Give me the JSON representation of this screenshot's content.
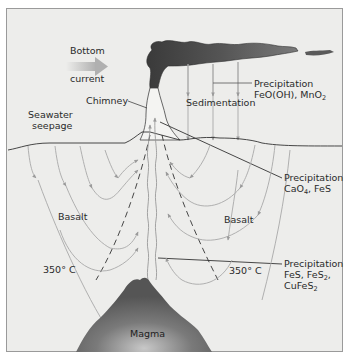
{
  "diagram": {
    "labels": {
      "bottom_current_line1": "Bottom",
      "bottom_current_line2": "current",
      "chimney": "Chimney",
      "seawater_line1": "Seawater",
      "seawater_line2": "seepage",
      "sedimentation": "Sedimentation",
      "precip_top_line1": "Precipitation",
      "precip_top_line2_a": "FeO(OH), MnO",
      "precip_top_line2_sub": "2",
      "precip_mid_line1": "Precipitation",
      "precip_mid_line2_a": "CaO",
      "precip_mid_line2_sub": "4",
      "precip_mid_line2_b": ", FeS",
      "precip_low_line1": "Precipitation",
      "precip_low_line2_a": "FeS, FeS",
      "precip_low_line2_sub": "2",
      "precip_low_line2_b": ",",
      "precip_low_line3_a": "CuFeS",
      "precip_low_line3_sub": "2",
      "basalt_left": "Basalt",
      "basalt_right": "Basalt",
      "temp_left": "350° C",
      "temp_right": "350° C",
      "magma": "Magma"
    },
    "colors": {
      "background": "#ededeb",
      "border": "#9a9a9a",
      "plume_dark": "#3c3c3c",
      "plume_light": "#8a8a8a",
      "magma_dark": "#4a4a4a",
      "magma_light": "#b5b5b5",
      "arrow_gray": "#a8a8a8",
      "line_dark": "#333333"
    }
  }
}
